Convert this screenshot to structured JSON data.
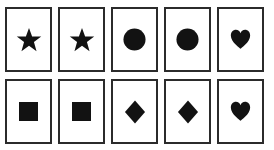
{
  "image": {
    "description": "Grid of ten rectangular cards, each displaying one solid black symbol",
    "background_color": "#ffffff",
    "card_fill_color": "#ffffff",
    "card_border_color": "#2b2b2b",
    "symbol_color": "#121212",
    "rows": 2,
    "columns": 5
  },
  "grid": {
    "rows": [
      {
        "row_name": "top-row",
        "cards": [
          {
            "position": "row1-col1",
            "symbol": "star-icon",
            "symbol_label": "star"
          },
          {
            "position": "row1-col2",
            "symbol": "star-icon",
            "symbol_label": "star"
          },
          {
            "position": "row1-col3",
            "symbol": "circle-icon",
            "symbol_label": "circle"
          },
          {
            "position": "row1-col4",
            "symbol": "circle-icon",
            "symbol_label": "circle"
          },
          {
            "position": "row1-col5",
            "symbol": "heart-icon",
            "symbol_label": "heart"
          }
        ]
      },
      {
        "row_name": "bottom-row",
        "cards": [
          {
            "position": "row2-col1",
            "symbol": "square-icon",
            "symbol_label": "square"
          },
          {
            "position": "row2-col2",
            "symbol": "square-icon",
            "symbol_label": "square"
          },
          {
            "position": "row2-col3",
            "symbol": "diamond-icon",
            "symbol_label": "diamond"
          },
          {
            "position": "row2-col4",
            "symbol": "diamond-icon",
            "symbol_label": "diamond"
          },
          {
            "position": "row2-col5",
            "symbol": "heart-icon",
            "symbol_label": "heart"
          }
        ]
      }
    ]
  }
}
